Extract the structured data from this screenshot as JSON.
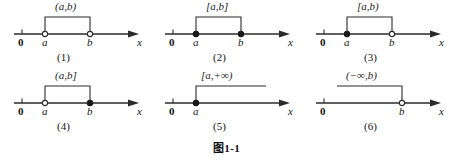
{
  "figure": {
    "caption_symbol": "图",
    "caption_number": "1-1",
    "axis_label": "x",
    "origin_label": "0"
  },
  "diagrams": [
    {
      "index": "(1)",
      "interval_label": "(a,b)",
      "left_point_label": "a",
      "right_point_label": "b",
      "left_endpoint": "open",
      "right_endpoint": "open",
      "kind": "bounded",
      "axis_label": "x",
      "origin_label": "0"
    },
    {
      "index": "(2)",
      "interval_label": "[a,b]",
      "left_point_label": "a",
      "right_point_label": "b",
      "left_endpoint": "closed",
      "right_endpoint": "closed",
      "kind": "bounded",
      "axis_label": "x",
      "origin_label": "0"
    },
    {
      "index": "(3)",
      "interval_label": "[a,b)",
      "left_point_label": "a",
      "right_point_label": "b",
      "left_endpoint": "closed",
      "right_endpoint": "open",
      "kind": "bounded",
      "axis_label": "x",
      "origin_label": "0"
    },
    {
      "index": "(4)",
      "interval_label": "(a,b]",
      "left_point_label": "a",
      "right_point_label": "b",
      "left_endpoint": "open",
      "right_endpoint": "closed",
      "kind": "bounded",
      "axis_label": "x",
      "origin_label": "0"
    },
    {
      "index": "(5)",
      "interval_label": "[a,+∞)",
      "left_point_label": "a",
      "right_point_label": "",
      "left_endpoint": "closed",
      "right_endpoint": "infinite",
      "kind": "ray-right",
      "axis_label": "x",
      "origin_label": "0"
    },
    {
      "index": "(6)",
      "interval_label": "(−∞,b)",
      "left_point_label": "",
      "right_point_label": "b",
      "left_endpoint": "infinite",
      "right_endpoint": "open",
      "kind": "ray-left",
      "axis_label": "x",
      "origin_label": "0"
    }
  ]
}
